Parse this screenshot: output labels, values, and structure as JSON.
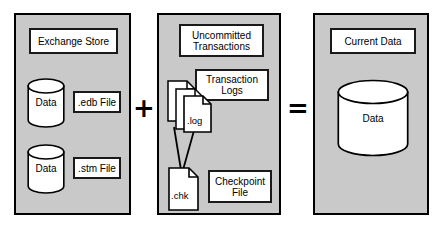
{
  "diagram": {
    "colors": {
      "panel_fill": "#c9c9c9",
      "panel_border": "#000000",
      "box_fill": "#ffffff",
      "box_border": "#1a1a1a",
      "text": "#000000"
    },
    "panels": [
      {
        "id": "exchange-store",
        "heading": "Exchange Store",
        "items": [
          {
            "cylinder_label": "Data",
            "file_label": ".edb File"
          },
          {
            "cylinder_label": "Data",
            "file_label": ".stm File"
          }
        ]
      },
      {
        "id": "uncommitted-transactions",
        "heading": "Uncommitted\nTransactions",
        "logs_label": "Transaction\nLogs",
        "log_icon_label": ".log",
        "checkpoint_icon_label": ".chk",
        "checkpoint_label": "Checkpoint\nFile"
      },
      {
        "id": "current-data",
        "heading": "Current Data",
        "cylinder_label": "Data"
      }
    ],
    "operators": {
      "plus": "+",
      "equals": "="
    }
  }
}
